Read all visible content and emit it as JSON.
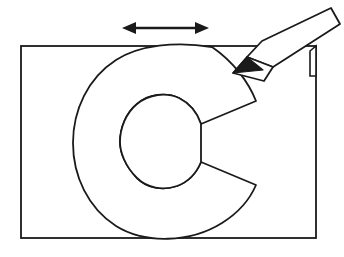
{
  "figure": {
    "background_color": "#ffffff",
    "line_color": "#1a1a1a",
    "fill_color": "#ffffff",
    "stroke_width": 1.8
  },
  "rectangle": {
    "name": "guide-box",
    "x": 21,
    "y": 46,
    "width": 295,
    "height": 192,
    "stroke_color": "#1a1a1a",
    "fill_color": "#ffffff"
  },
  "letter": {
    "character": "C",
    "style": "outline",
    "stroke_color": "#1a1a1a",
    "fill_color": "#ffffff",
    "outer_path": "M 212,47 C 176,41 139,45 116,60 C 88,78 73,110 73,143 C 73,176 88,208 116,226 C 145,244 190,243 222,223 C 238,213 250,199 256,185 L 201,162 C 196,174 188,182 177,186 C 163,191 147,188 137,178 C 125,166 120,152 120,142 C 120,128 126,113 137,104 C 149,94 166,92 179,98 C 189,103 197,112 201,124 L 256,101 C 249,83 234,62 212,47 Z",
    "counter_path": "M 137,104 C 126,113 120,128 120,142 C 120,152 125,166 137,178 C 147,188 163,191 177,186 C 188,182 196,174 201,162 L 201,124 C 197,112 189,103 179,98 C 166,92 149,94 137,104 Z",
    "upper_terminal_label": "start-of-stroke",
    "lower_terminal_label": "end-of-stroke"
  },
  "pencil": {
    "name": "pencil",
    "angle_description": "pointing down-left toward the upper terminal of the C",
    "body_color": "#ffffff",
    "outline_color": "#1a1a1a",
    "tip_color": "#1a1a1a",
    "tip_x": 233,
    "tip_y": 73,
    "body_path": "M 247,57 L 262,41 L 331,8 L 340,24 L 273,67 Z",
    "ferrule_path": "M 247,57 L 273,67 L 264,81 L 233,73 Z",
    "point_path": "M 247,57 L 263,70 L 233,73 Z"
  },
  "arrow": {
    "name": "direction-arrow",
    "type": "double-headed-horizontal",
    "color": "#1a1a1a",
    "x_start": 122,
    "x_end": 209,
    "y": 28,
    "shaft_thickness": 2.6,
    "head_length": 14,
    "head_half_width": 6
  },
  "notch": {
    "name": "box-corner-sliver",
    "description": "sliver of the rectangle corner showing past the pencil body",
    "path": "M 310,51 L 316,46 L 316,76 L 310,76 Z"
  }
}
